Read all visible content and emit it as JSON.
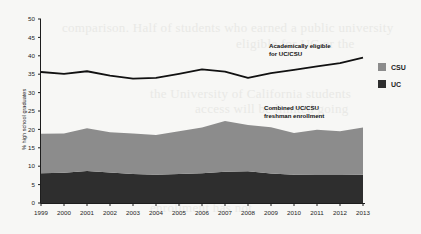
{
  "background_text": [
    {
      "text": "comparison. Half of students who earned a public university",
      "x": 62,
      "y": 20
    },
    {
      "text": "eligible for UC or the",
      "x": 236,
      "y": 36
    },
    {
      "text": "the University of California students",
      "x": 150,
      "y": 86
    },
    {
      "text": "access will be limited going",
      "x": 195,
      "y": 101
    },
    {
      "text": "the state's high school students were",
      "x": 92,
      "y": 134
    },
    {
      "text": "admission to the university system over",
      "x": 120,
      "y": 168
    },
    {
      "text": "enrollment has not",
      "x": 150,
      "y": 200
    }
  ],
  "legend": {
    "position": "right",
    "items": [
      {
        "label": "CSU",
        "color": "#8c8c8c",
        "name": "legend-item-csu"
      },
      {
        "label": "UC",
        "color": "#2e2e2e",
        "name": "legend-item-uc"
      }
    ]
  },
  "annotations": [
    {
      "name": "annotation-eligible",
      "line1": "Academically eligible",
      "line2": "for UC/CSU"
    },
    {
      "name": "annotation-enrollment",
      "line1": "Combined UC/CSU",
      "line2": "freshman enrollment"
    }
  ],
  "chart_data": {
    "type": "area",
    "title": "",
    "xlabel": "",
    "ylabel": "% high school graduates",
    "ylim": [
      0,
      50
    ],
    "yticks": [
      0,
      5,
      10,
      15,
      20,
      25,
      30,
      35,
      40,
      45,
      50
    ],
    "grid": false,
    "legend_position": "right",
    "categories": [
      1999,
      2000,
      2001,
      2002,
      2003,
      2004,
      2005,
      2006,
      2007,
      2008,
      2009,
      2010,
      2011,
      2012,
      2013
    ],
    "x_tick_labels": [
      "1999",
      "2000",
      "2001",
      "2002",
      "2003",
      "2004",
      "2005",
      "2006",
      "2007",
      "2008",
      "2009",
      "2010",
      "2011",
      "2012",
      "2013"
    ],
    "series": [
      {
        "name": "UC",
        "type": "area-stacked",
        "color": "#2e2e2e",
        "values": [
          8.1,
          8.2,
          8.7,
          8.3,
          7.9,
          7.7,
          7.9,
          8.1,
          8.5,
          8.6,
          8.0,
          7.7,
          7.6,
          7.6,
          7.7
        ]
      },
      {
        "name": "CSU",
        "type": "area-stacked",
        "color": "#8c8c8c",
        "values": [
          10.7,
          10.7,
          11.6,
          10.9,
          11.0,
          10.8,
          11.6,
          12.4,
          13.8,
          12.6,
          12.6,
          11.3,
          12.3,
          11.9,
          12.8
        ]
      },
      {
        "name": "Academically eligible for UC/CSU",
        "type": "line",
        "color": "#111111",
        "values": [
          35.6,
          35.1,
          35.8,
          34.6,
          33.8,
          34.0,
          35.1,
          36.3,
          35.7,
          34.0,
          35.3,
          36.2,
          37.1,
          38.0,
          39.5
        ]
      }
    ],
    "stacked_totals": [
      18.8,
      18.9,
      20.3,
      19.2,
      18.9,
      18.5,
      19.5,
      20.5,
      22.3,
      21.2,
      20.6,
      19.0,
      19.9,
      19.5,
      20.5
    ]
  }
}
